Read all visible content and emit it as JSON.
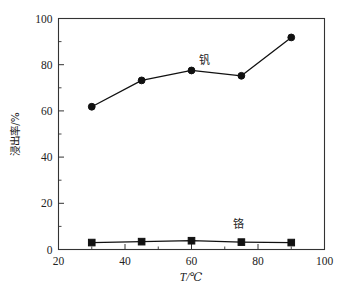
{
  "chart_data": {
    "type": "line",
    "title": "",
    "xlabel": "T/℃",
    "ylabel": "浸出率/%",
    "xlim": [
      20,
      100
    ],
    "ylim": [
      0,
      100
    ],
    "xticks": [
      20,
      40,
      60,
      80,
      100
    ],
    "yticks": [
      0,
      20,
      40,
      60,
      80,
      100
    ],
    "xtick_labels": [
      "20",
      "40",
      "60",
      "80",
      "100"
    ],
    "ytick_labels": [
      "0",
      "20",
      "40",
      "60",
      "80",
      "100"
    ],
    "x_minor_ticks": [
      30,
      50,
      70,
      90
    ],
    "y_minor_ticks": [
      10,
      30,
      50,
      70,
      90
    ],
    "grid": false,
    "legend_position": "inline-annotation",
    "x": [
      30,
      45,
      60,
      75,
      90
    ],
    "series": [
      {
        "name": "钒",
        "label": "钒",
        "marker": "circle",
        "color": "#111111",
        "values": [
          61.8,
          73.2,
          77.5,
          75.2,
          91.8
        ],
        "label_x": 64,
        "label_y": 80.5
      },
      {
        "name": "铬",
        "label": "铬",
        "marker": "square",
        "color": "#111111",
        "values": [
          3.0,
          3.4,
          3.8,
          3.2,
          3.0
        ],
        "label_x": 74,
        "label_y": 9.5
      }
    ]
  },
  "axes": {
    "x_axis_name": "temperature-axis",
    "y_axis_name": "leaching-rate-axis"
  }
}
